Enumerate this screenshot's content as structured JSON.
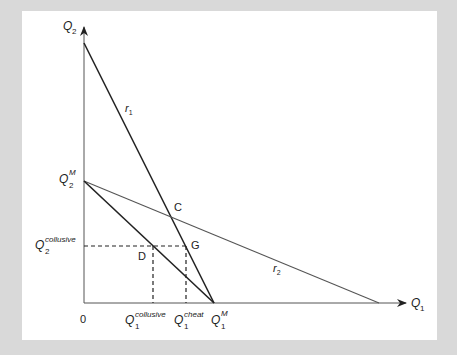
{
  "diagram": {
    "type": "economics-reaction-functions",
    "axes": {
      "x": {
        "label": "Q",
        "subscript": "1"
      },
      "y": {
        "label": "Q",
        "subscript": "2"
      },
      "origin_label": "0"
    },
    "lines": {
      "r1": {
        "label": "r",
        "subscript": "1"
      },
      "r2": {
        "label": "r",
        "subscript": "2"
      }
    },
    "points": {
      "C": "C",
      "D": "D",
      "G": "G"
    },
    "tick_labels": {
      "q2_monopoly": {
        "label": "Q",
        "sup": "M",
        "sub": "2"
      },
      "q2_collusive": {
        "label": "Q",
        "sup": "collusive",
        "sub": "2"
      },
      "q1_collusive": {
        "label": "Q",
        "sup": "collusive",
        "sub": "1"
      },
      "q1_cheat": {
        "label": "Q",
        "sup": "cheat",
        "sub": "1"
      },
      "q1_monopoly": {
        "label": "Q",
        "sup": "M",
        "sub": "1"
      }
    },
    "colors": {
      "background": "#d9d9d9",
      "panel": "#ffffff",
      "ink": "#222222",
      "r2_line": "#555555"
    }
  }
}
